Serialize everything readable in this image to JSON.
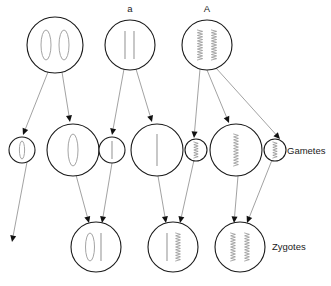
{
  "diagram": {
    "canvas": {
      "width": 331,
      "height": 286
    },
    "colors": {
      "background": "#ffffff",
      "cell_outline": "#1a1a1a",
      "chromosome_gray": "#9a9a9a",
      "link_line": "#8a8a8a",
      "arrow_head": "#111111",
      "text": "#1a1a1a"
    },
    "labels": {
      "allele_a": "a",
      "allele_A": "A",
      "gametes": "Gametes",
      "zygotes": "Zygotes"
    },
    "rows": {
      "parents": {
        "cells": [
          {
            "name": "parent-cell-1",
            "cx": 55,
            "cy": 45,
            "r": 28,
            "label": "",
            "contents": [
              {
                "type": "ellipse",
                "cx": 46,
                "cy": 45,
                "rx": 5,
                "ry": 15
              },
              {
                "type": "ellipse",
                "cx": 64,
                "cy": 45,
                "rx": 5,
                "ry": 15
              }
            ]
          },
          {
            "name": "parent-cell-2",
            "cx": 130,
            "cy": 45,
            "r": 25,
            "label": "a",
            "label_x": 130,
            "label_y": 12,
            "contents": [
              {
                "type": "line",
                "x": 125,
                "y1": 31,
                "y2": 59
              },
              {
                "type": "line",
                "x": 134,
                "y1": 31,
                "y2": 59
              }
            ]
          },
          {
            "name": "parent-cell-3",
            "cx": 207,
            "cy": 45,
            "r": 25,
            "label": "A",
            "label_x": 207,
            "label_y": 12,
            "contents": [
              {
                "type": "squiggle",
                "x": 200,
                "y1": 30,
                "y2": 60,
                "amp": 2.6,
                "cycles": 11
              },
              {
                "type": "squiggle",
                "x": 214,
                "y1": 30,
                "y2": 60,
                "amp": 2.6,
                "cycles": 11
              }
            ]
          }
        ]
      },
      "gametes": {
        "row_label": "Gametes",
        "row_label_x": 287,
        "row_label_y": 154,
        "cells": [
          {
            "name": "gamete-cell-1",
            "cx": 22,
            "cy": 150,
            "r": 13,
            "contents": [
              {
                "type": "ellipse",
                "cx": 22,
                "cy": 150,
                "rx": 2.6,
                "ry": 9
              }
            ]
          },
          {
            "name": "gamete-cell-2",
            "cx": 73,
            "cy": 150,
            "r": 26,
            "contents": [
              {
                "type": "ellipse",
                "cx": 73,
                "cy": 150,
                "rx": 5,
                "ry": 16
              }
            ]
          },
          {
            "name": "gamete-cell-3",
            "cx": 112,
            "cy": 150,
            "r": 13,
            "contents": [
              {
                "type": "line",
                "x": 112,
                "y1": 141,
                "y2": 159
              }
            ]
          },
          {
            "name": "gamete-cell-4",
            "cx": 157,
            "cy": 150,
            "r": 26,
            "contents": [
              {
                "type": "line",
                "x": 157,
                "y1": 134,
                "y2": 166
              }
            ]
          },
          {
            "name": "gamete-cell-5",
            "cx": 196,
            "cy": 150,
            "r": 11,
            "contents": [
              {
                "type": "squiggle",
                "x": 196,
                "y1": 142,
                "y2": 158,
                "amp": 2.2,
                "cycles": 6
              }
            ]
          },
          {
            "name": "gamete-cell-6",
            "cx": 236,
            "cy": 150,
            "r": 26,
            "contents": [
              {
                "type": "squiggle",
                "x": 236,
                "y1": 134,
                "y2": 166,
                "amp": 2.4,
                "cycles": 11
              }
            ]
          },
          {
            "name": "gamete-cell-7",
            "cx": 275,
            "cy": 150,
            "r": 11,
            "contents": [
              {
                "type": "squiggle",
                "x": 275,
                "y1": 142,
                "y2": 158,
                "amp": 2.2,
                "cycles": 6
              }
            ]
          }
        ]
      },
      "zygotes": {
        "row_label": "Zygotes",
        "row_label_x": 272,
        "row_label_y": 250,
        "cells": [
          {
            "name": "zygote-cell-1",
            "cx": 96,
            "cy": 247,
            "r": 25,
            "contents": [
              {
                "type": "ellipse",
                "cx": 90,
                "cy": 247,
                "rx": 4.5,
                "ry": 14
              },
              {
                "type": "line",
                "x": 101,
                "y1": 233,
                "y2": 261
              }
            ]
          },
          {
            "name": "zygote-cell-2",
            "cx": 173,
            "cy": 247,
            "r": 25,
            "contents": [
              {
                "type": "line",
                "x": 167,
                "y1": 233,
                "y2": 261
              },
              {
                "type": "squiggle",
                "x": 178,
                "y1": 233,
                "y2": 261,
                "amp": 2.4,
                "cycles": 10
              }
            ]
          },
          {
            "name": "zygote-cell-3",
            "cx": 240,
            "cy": 247,
            "r": 25,
            "contents": [
              {
                "type": "squiggle",
                "x": 233,
                "y1": 233,
                "y2": 261,
                "amp": 2.4,
                "cycles": 10
              },
              {
                "type": "squiggle",
                "x": 247,
                "y1": 233,
                "y2": 261,
                "amp": 2.4,
                "cycles": 10
              }
            ]
          }
        ]
      }
    },
    "arrows": [
      {
        "name": "arrow-parent1-to-gamete1",
        "x1": 48,
        "y1": 72,
        "x2": 23,
        "y2": 135
      },
      {
        "name": "arrow-parent1-to-gamete2",
        "x1": 62,
        "y1": 72,
        "x2": 70,
        "y2": 122
      },
      {
        "name": "arrow-parent2-to-gamete3",
        "x1": 124,
        "y1": 69,
        "x2": 112,
        "y2": 135
      },
      {
        "name": "arrow-parent2-to-gamete4",
        "x1": 136,
        "y1": 69,
        "x2": 152,
        "y2": 122
      },
      {
        "name": "arrow-parent3-to-gamete5",
        "x1": 200,
        "y1": 69,
        "x2": 194,
        "y2": 138
      },
      {
        "name": "arrow-parent3-to-gamete6",
        "x1": 207,
        "y1": 70,
        "x2": 229,
        "y2": 123
      },
      {
        "name": "arrow-parent3-to-gamete7",
        "x1": 216,
        "y1": 68,
        "x2": 280,
        "y2": 139
      },
      {
        "name": "arrow-gamete1-to-void",
        "x1": 27,
        "y1": 162,
        "x2": 12,
        "y2": 242
      },
      {
        "name": "arrow-gamete2-to-zygote1",
        "x1": 76,
        "y1": 175,
        "x2": 89,
        "y2": 223
      },
      {
        "name": "arrow-gamete3-to-zygote1",
        "x1": 112,
        "y1": 163,
        "x2": 102,
        "y2": 223
      },
      {
        "name": "arrow-gamete4-to-zygote2",
        "x1": 158,
        "y1": 176,
        "x2": 166,
        "y2": 223
      },
      {
        "name": "arrow-gamete5-to-zygote2",
        "x1": 194,
        "y1": 160,
        "x2": 180,
        "y2": 223
      },
      {
        "name": "arrow-gamete6-to-zygote3",
        "x1": 238,
        "y1": 176,
        "x2": 234,
        "y2": 223
      },
      {
        "name": "arrow-gamete7-to-zygote3",
        "x1": 272,
        "y1": 160,
        "x2": 247,
        "y2": 223
      }
    ]
  }
}
